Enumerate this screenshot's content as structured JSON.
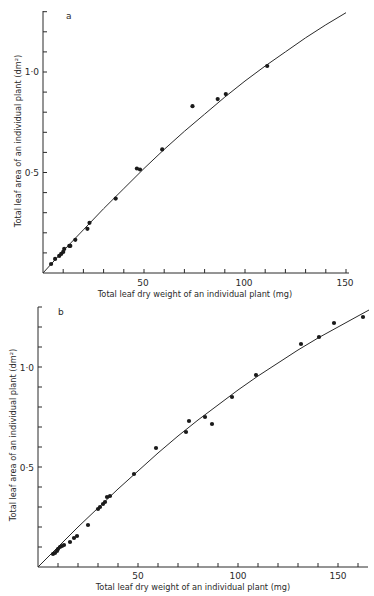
{
  "chart_data": [
    {
      "type": "scatter",
      "panel_label": "a",
      "title": "",
      "xlabel": "Total leaf dry weight of an individual plant (mg)",
      "ylabel": "Total leaf area of an individual plant (dm²)",
      "xlim": [
        0,
        150
      ],
      "ylim": [
        0,
        1.3
      ],
      "x_ticks": [
        50,
        100,
        150
      ],
      "x_tick_labels": [
        "50",
        "100",
        "150"
      ],
      "x_minor_step": 10,
      "y_ticks": [
        0.5,
        1.0
      ],
      "y_tick_labels": [
        "0·5",
        "1·0"
      ],
      "y_minor_step": 0.1,
      "grid": false,
      "legend": null,
      "series": [
        {
          "name": "observed",
          "kind": "points",
          "x": [
            4,
            6,
            8,
            9,
            10,
            10.5,
            13,
            13.5,
            16,
            22,
            23,
            36,
            46.5,
            48,
            59,
            74,
            86.5,
            90.5,
            111
          ],
          "y": [
            0.045,
            0.07,
            0.085,
            0.095,
            0.105,
            0.12,
            0.135,
            0.135,
            0.165,
            0.22,
            0.25,
            0.37,
            0.52,
            0.515,
            0.615,
            0.83,
            0.865,
            0.89,
            1.03
          ]
        },
        {
          "name": "fitted curve",
          "kind": "line",
          "x": [
            0,
            10,
            20,
            30,
            40,
            50,
            60,
            70,
            80,
            90,
            100,
            110,
            120,
            130,
            140,
            150
          ],
          "y": [
            0,
            0.11,
            0.215,
            0.32,
            0.42,
            0.52,
            0.615,
            0.705,
            0.79,
            0.875,
            0.955,
            1.03,
            1.1,
            1.17,
            1.235,
            1.295
          ]
        }
      ]
    },
    {
      "type": "scatter",
      "panel_label": "b",
      "title": "",
      "xlabel": "Total leaf dry weight of an individual plant (mg)",
      "ylabel": "Total leaf area of an individual plant (dm²)",
      "xlim": [
        0,
        165
      ],
      "ylim": [
        0,
        1.3
      ],
      "x_ticks": [
        50,
        100,
        150
      ],
      "x_tick_labels": [
        "50",
        "100",
        "150"
      ],
      "x_minor_step": 10,
      "y_ticks": [
        0.5,
        1.0
      ],
      "y_tick_labels": [
        "0·5",
        "1·0"
      ],
      "y_minor_step": 0.1,
      "grid": false,
      "legend": null,
      "series": [
        {
          "name": "observed",
          "kind": "points",
          "x": [
            7.5,
            8.5,
            9.5,
            10,
            11,
            12,
            13,
            16,
            18,
            19.5,
            25,
            30,
            31,
            32.5,
            33.5,
            34.5,
            36,
            48,
            59,
            74,
            75.5,
            83.5,
            87,
            97,
            109,
            131.5,
            140.5,
            148,
            162.5
          ],
          "y": [
            0.065,
            0.07,
            0.08,
            0.09,
            0.1,
            0.105,
            0.11,
            0.125,
            0.145,
            0.155,
            0.21,
            0.29,
            0.3,
            0.315,
            0.325,
            0.35,
            0.355,
            0.465,
            0.595,
            0.675,
            0.73,
            0.75,
            0.715,
            0.85,
            0.96,
            1.115,
            1.15,
            1.22,
            1.25
          ]
        },
        {
          "name": "fitted curve",
          "kind": "line",
          "x": [
            0,
            10,
            20,
            30,
            40,
            50,
            60,
            70,
            80,
            90,
            100,
            110,
            120,
            130,
            140,
            150,
            160,
            165.5
          ],
          "y": [
            0,
            0.1,
            0.2,
            0.295,
            0.39,
            0.48,
            0.57,
            0.655,
            0.735,
            0.81,
            0.885,
            0.955,
            1.02,
            1.085,
            1.145,
            1.2,
            1.255,
            1.285
          ]
        }
      ]
    }
  ],
  "panels": [
    {
      "letter": "a",
      "xlabel": "Total leaf dry weight of an individual plant (mg)",
      "ylabel": "Total leaf area of an individual plant (dm²)",
      "x_tick_labels": [
        "50",
        "100",
        "150"
      ],
      "y_tick_labels": [
        "0·5",
        "1·0"
      ]
    },
    {
      "letter": "b",
      "xlabel": "Total leaf dry weight of an individual plant (mg)",
      "ylabel": "Total leaf area of an individual plant (dm²)",
      "x_tick_labels": [
        "50",
        "100",
        "150"
      ],
      "y_tick_labels": [
        "0·5",
        "1·0"
      ]
    }
  ]
}
